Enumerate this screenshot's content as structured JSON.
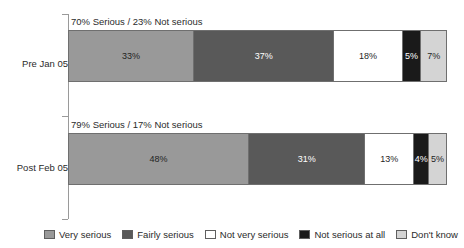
{
  "chart_data": {
    "type": "bar",
    "subtype": "stacked-horizontal-100pct",
    "title": "",
    "xlabel": "",
    "ylabel": "",
    "xlim": [
      0,
      100
    ],
    "grid": false,
    "legend_position": "bottom",
    "categories": [
      "Pre Jan 05",
      "Post Feb 05"
    ],
    "series": [
      {
        "name": "Very serious",
        "color": "#999999",
        "text_color": "#1f1f1f",
        "values": [
          33,
          48
        ],
        "labels": [
          "33%",
          "48%"
        ]
      },
      {
        "name": "Fairly serious",
        "color": "#595959",
        "text_color": "#ffffff",
        "values": [
          37,
          31
        ],
        "labels": [
          "37%",
          "31%"
        ]
      },
      {
        "name": "Not very serious",
        "color": "#ffffff",
        "text_color": "#1f1f1f",
        "values": [
          18,
          13
        ],
        "labels": [
          "18%",
          "13%"
        ]
      },
      {
        "name": "Not serious at all",
        "color": "#1a1a1a",
        "text_color": "#ffffff",
        "values": [
          5,
          4
        ],
        "labels": [
          "5%",
          "4%"
        ]
      },
      {
        "name": "Don't know",
        "color": "#d4d4d4",
        "text_color": "#1f1f1f",
        "values": [
          7,
          5
        ],
        "labels": [
          "7%",
          "5%"
        ]
      }
    ],
    "annotations": [
      "70% Serious / 23% Not serious",
      "79% Serious / 17% Not serious"
    ]
  },
  "legend": {
    "items": [
      {
        "label": "Very serious"
      },
      {
        "label": "Fairly serious"
      },
      {
        "label": "Not very serious"
      },
      {
        "label": "Not serious at all"
      },
      {
        "label": "Don't know"
      }
    ]
  }
}
